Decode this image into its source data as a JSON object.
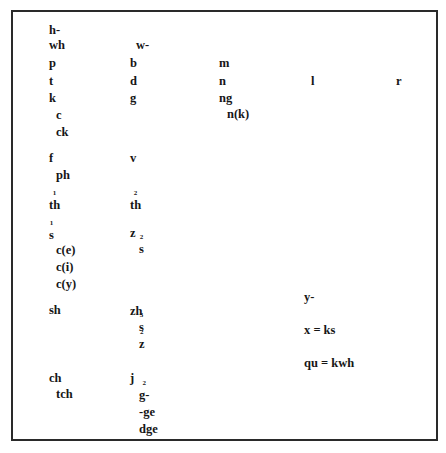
{
  "table": {
    "col1": {
      "h": "h-",
      "wh": "wh",
      "p": "p",
      "t": "t",
      "k": "k",
      "c": "c",
      "ck": "ck",
      "f": "f",
      "ph": "ph",
      "th1": "th",
      "th1_mark": "1",
      "s1": "s",
      "s1_mark": "1",
      "ce": "c(e)",
      "ci": "c(i)",
      "cy": "c(y)",
      "sh": "sh",
      "ch": "ch",
      "tch": "tch"
    },
    "col2": {
      "w": "w-",
      "b": "b",
      "d": "d",
      "g": "g",
      "v": "v",
      "th2": "th",
      "th2_mark": "2",
      "z": "z",
      "s2": "s",
      "s2_mark": "2",
      "zh": "zh",
      "s3": "s",
      "s3_mark": "3",
      "z2": "z",
      "z2_mark": "2",
      "j": "j",
      "g2": "g-",
      "g2_mark": "2",
      "ge": "-ge",
      "dge": "dge"
    },
    "col3": {
      "m": "m",
      "n": "n",
      "ng": "ng",
      "nk": "n(k)",
      "y": "y-",
      "x": "x = ks",
      "qu": "qu = kwh"
    },
    "col4": {
      "l": "l"
    },
    "col5": {
      "r": "r"
    }
  }
}
